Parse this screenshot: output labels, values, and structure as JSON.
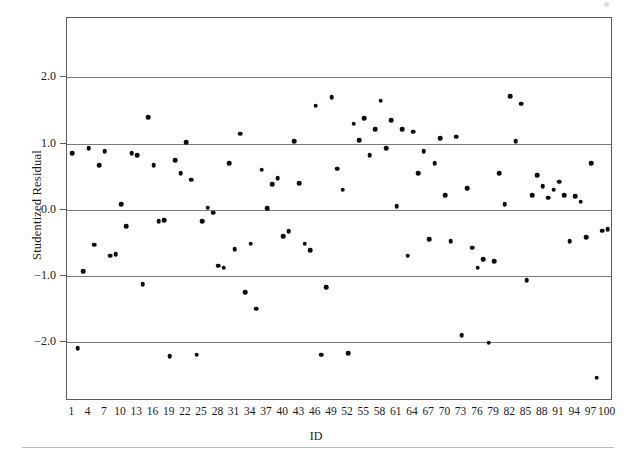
{
  "chart_data": {
    "type": "scatter",
    "title": "",
    "xlabel": "ID",
    "ylabel": "Studentized Residual",
    "xlim": [
      0,
      101
    ],
    "ylim": [
      -2.9,
      2.9
    ],
    "grid": true,
    "grid_axis": "y",
    "legend": "none",
    "marker": "filled-circle",
    "marker_color": "#0d0d0d",
    "frame": true,
    "y_ticks": [
      2.0,
      1.0,
      0.0,
      -1.0,
      -2.0
    ],
    "y_tick_labels": [
      "2.0",
      "1.0",
      "0.0",
      "-1.0",
      "-2.0"
    ],
    "x_ticks": [
      1,
      4,
      7,
      10,
      13,
      16,
      19,
      22,
      25,
      28,
      31,
      34,
      37,
      40,
      43,
      46,
      49,
      52,
      55,
      58,
      61,
      64,
      67,
      70,
      73,
      76,
      79,
      82,
      85,
      88,
      91,
      94,
      97,
      100
    ],
    "x_tick_labels": [
      "1",
      "4",
      "7",
      "10",
      "13",
      "16",
      "19",
      "22",
      "25",
      "28",
      "31",
      "34",
      "37",
      "40",
      "43",
      "46",
      "49",
      "52",
      "55",
      "58",
      "61",
      "64",
      "67",
      "70",
      "73",
      "76",
      "79",
      "82",
      "85",
      "88",
      "91",
      "94",
      "97",
      "100"
    ],
    "x": [
      1,
      2,
      3,
      4,
      5,
      6,
      7,
      8,
      9,
      10,
      11,
      12,
      13,
      14,
      15,
      16,
      17,
      18,
      19,
      20,
      21,
      22,
      23,
      24,
      25,
      26,
      27,
      28,
      29,
      30,
      31,
      32,
      33,
      34,
      35,
      36,
      37,
      38,
      39,
      40,
      41,
      42,
      43,
      44,
      45,
      46,
      47,
      48,
      49,
      50,
      51,
      52,
      53,
      54,
      55,
      56,
      57,
      58,
      59,
      60,
      61,
      62,
      63,
      64,
      65,
      66,
      67,
      68,
      69,
      70,
      71,
      72,
      73,
      74,
      75,
      76,
      77,
      78,
      79,
      80,
      81,
      82,
      83,
      84,
      85,
      86,
      87,
      88,
      89,
      90,
      91,
      92,
      93,
      94,
      95,
      96,
      97,
      98,
      99,
      100
    ],
    "y": [
      0.85,
      -2.1,
      -0.93,
      0.93,
      -0.53,
      0.67,
      0.88,
      -0.7,
      -0.68,
      0.08,
      -0.25,
      0.85,
      0.82,
      -1.13,
      1.4,
      0.67,
      -0.18,
      -0.16,
      -2.22,
      0.75,
      0.55,
      1.02,
      0.45,
      -2.2,
      -0.18,
      0.03,
      -0.05,
      -0.85,
      -0.88,
      0.7,
      -0.6,
      1.15,
      -1.25,
      -0.52,
      -1.5,
      0.6,
      0.02,
      0.38,
      0.47,
      -0.4,
      -0.33,
      1.03,
      0.4,
      -0.52,
      -0.62,
      1.57,
      -2.2,
      -1.18,
      1.7,
      0.62,
      0.3,
      -2.18,
      1.3,
      1.05,
      1.38,
      0.82,
      1.22,
      1.65,
      0.93,
      1.35,
      0.05,
      1.22,
      -0.7,
      1.18,
      0.55,
      0.88,
      -0.45,
      0.7,
      1.08,
      0.22,
      -0.48,
      1.1,
      -1.9,
      0.32,
      -0.58,
      -0.88,
      -0.75,
      -2.02,
      -0.78,
      0.55,
      0.08,
      1.72,
      1.03,
      1.6,
      -1.07,
      0.22,
      0.52,
      0.35,
      0.18,
      0.3,
      0.42,
      0.22,
      -0.48,
      0.2,
      0.12,
      -0.42,
      0.7,
      -2.55,
      -0.32,
      -0.3
    ],
    "n_points": 100,
    "point_count_label": ""
  },
  "figure": {
    "background_color": "#ffffff",
    "axis_color": "#5a5a5a",
    "gridline_color": "#7a7a7a",
    "bottom_rule_color": "#b9b9b9"
  }
}
